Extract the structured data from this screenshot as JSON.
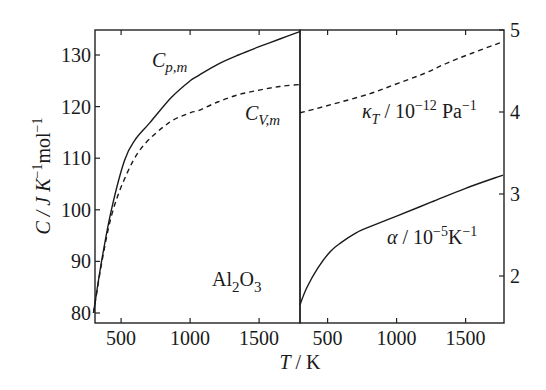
{
  "chart_data": [
    {
      "type": "line",
      "title": "",
      "annotation": "Al2O3",
      "xlabel": "T / K",
      "ylabel": "C / J K^-1 mol^-1",
      "xlim": [
        300,
        1800
      ],
      "ylim": [
        78,
        135
      ],
      "x_ticks": [
        500,
        1000,
        1500
      ],
      "y_ticks": [
        80,
        90,
        100,
        110,
        120,
        130
      ],
      "grid": false,
      "series": [
        {
          "name": "C_p,m",
          "style": "solid",
          "x": [
            300,
            360,
            430,
            525,
            600,
            706,
            865,
            1000,
            1060,
            1200,
            1350,
            1500,
            1650,
            1800
          ],
          "values": [
            80.0,
            90.3,
            100.0,
            109.6,
            113.5,
            116.8,
            121.8,
            125.0,
            126.0,
            128.2,
            130.0,
            131.6,
            133.1,
            134.6
          ]
        },
        {
          "name": "C_V,m",
          "style": "dashed",
          "x": [
            300,
            360,
            430,
            525,
            648,
            843,
            1000,
            1060,
            1200,
            1350,
            1500,
            1650,
            1800
          ],
          "values": [
            80.0,
            89.8,
            98.8,
            106.0,
            112.0,
            116.8,
            118.8,
            119.2,
            120.9,
            122.3,
            123.2,
            123.9,
            124.3
          ]
        }
      ],
      "labels": [
        {
          "text": "C_p,m",
          "x": 900,
          "y": 128
        },
        {
          "text": "C_V,m",
          "x": 1500,
          "y": 117
        }
      ]
    },
    {
      "type": "line",
      "title": "",
      "xlabel": "T / K",
      "ylabel_right": "",
      "xlim": [
        300,
        1780
      ],
      "ylim": [
        1.57,
        5
      ],
      "x_ticks": [
        500,
        1000,
        1500
      ],
      "y_ticks": [
        2,
        3,
        4,
        5
      ],
      "grid": false,
      "series": [
        {
          "name": "κ_T / 10^-12 Pa^-1",
          "style": "dashed",
          "x": [
            300,
            525,
            800,
            1010,
            1200,
            1370,
            1550,
            1760
          ],
          "values": [
            3.99,
            4.09,
            4.22,
            4.35,
            4.47,
            4.6,
            4.72,
            4.85
          ]
        },
        {
          "name": "α / 10^-5 K^-1",
          "style": "solid",
          "x": [
            300,
            350,
            430,
            520,
            600,
            700,
            775,
            1000,
            1250,
            1500,
            1770
          ],
          "values": [
            1.65,
            1.86,
            2.1,
            2.3,
            2.41,
            2.52,
            2.58,
            2.73,
            2.9,
            3.07,
            3.23
          ]
        }
      ]
    }
  ],
  "labels": {
    "y_axis_title_main": "C / J K",
    "y_axis_title_sup1": "−1",
    "y_axis_title_mid": "mol",
    "y_axis_title_sup2": "−1",
    "x_axis_title": "T / K",
    "cp_main": "C",
    "cp_sub": "p,m",
    "cv_main": "C",
    "cv_sub": "V,m",
    "kappa_main": "κ",
    "kappa_sub": "T",
    "kappa_unit": " / 10",
    "kappa_exp": "−12",
    "kappa_unit2": " Pa",
    "kappa_exp2": "−1",
    "alpha_main": "α",
    "alpha_unit": " / 10",
    "alpha_exp": "−5",
    "alpha_unit2": "K",
    "alpha_exp2": "−1",
    "compound_al": "Al",
    "compound_sub1": "2",
    "compound_o": "O",
    "compound_sub2": "3",
    "left_y_ticks": [
      "80",
      "90",
      "100",
      "110",
      "120",
      "130"
    ],
    "right_y_ticks": [
      "2",
      "3",
      "4",
      "5"
    ],
    "x_ticks": [
      "500",
      "1000",
      "1500"
    ]
  }
}
